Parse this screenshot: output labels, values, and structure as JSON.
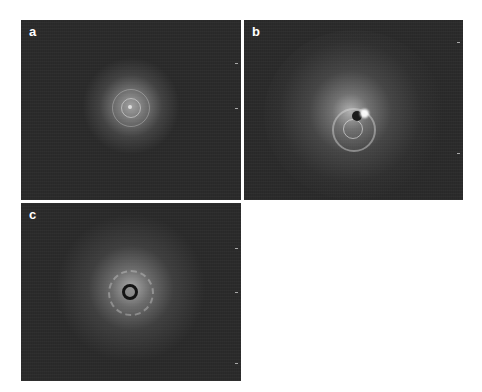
{
  "figure": {
    "panels": [
      {
        "label": "a",
        "description": "speckle diffraction pattern with small centered halo and concentric rings"
      },
      {
        "label": "b",
        "description": "diffraction pattern with broad halo, ring and bright asymmetric spot near center"
      },
      {
        "label": "c",
        "description": "diffraction pattern with halo and dark circular beam stop at center"
      }
    ]
  },
  "colors": {
    "background": "#ffffff",
    "panel": "#2b2b2b",
    "label": "#ffffff"
  }
}
